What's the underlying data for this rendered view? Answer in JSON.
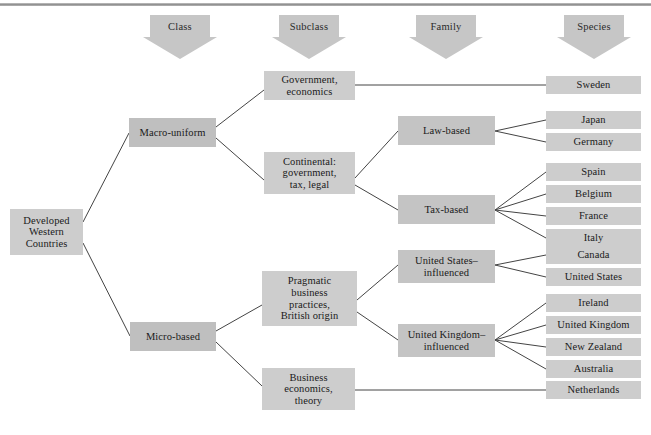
{
  "diagram": {
    "box_color": "#c9c9c9",
    "line_color": "#444444",
    "arrow_color": "#c6c6c6",
    "headers": [
      {
        "id": "class",
        "label": "Class"
      },
      {
        "id": "subclass",
        "label": "Subclass"
      },
      {
        "id": "family",
        "label": "Family"
      },
      {
        "id": "species",
        "label": "Species"
      }
    ],
    "root": {
      "id": "root",
      "label": "Developed\nWestern\nCountries"
    },
    "classes": [
      {
        "id": "macro",
        "label": "Macro-uniform"
      },
      {
        "id": "micro",
        "label": "Micro-based"
      }
    ],
    "subclasses": [
      {
        "id": "gov-econ",
        "label": "Government,\neconomics"
      },
      {
        "id": "continental",
        "label": "Continental:\ngovernment,\ntax, legal"
      },
      {
        "id": "pragmatic",
        "label": "Pragmatic\nbusiness\npractices,\nBritish origin"
      },
      {
        "id": "bus-econ",
        "label": "Business\neconomics,\ntheory"
      }
    ],
    "families": [
      {
        "id": "law-based",
        "label": "Law-based"
      },
      {
        "id": "tax-based",
        "label": "Tax-based"
      },
      {
        "id": "us-infl",
        "label": "United States–\ninfluenced"
      },
      {
        "id": "uk-infl",
        "label": "United Kingdom–\ninfluenced"
      }
    ],
    "species": [
      {
        "id": "sweden",
        "label": "Sweden"
      },
      {
        "id": "japan",
        "label": "Japan"
      },
      {
        "id": "germany",
        "label": "Germany"
      },
      {
        "id": "spain",
        "label": "Spain"
      },
      {
        "id": "belgium",
        "label": "Belgium"
      },
      {
        "id": "france",
        "label": "France"
      },
      {
        "id": "italy",
        "label": "Italy"
      },
      {
        "id": "canada",
        "label": "Canada"
      },
      {
        "id": "united-states",
        "label": "United States"
      },
      {
        "id": "ireland",
        "label": "Ireland"
      },
      {
        "id": "united-kingdom",
        "label": "United Kingdom"
      },
      {
        "id": "new-zealand",
        "label": "New Zealand"
      },
      {
        "id": "australia",
        "label": "Australia"
      },
      {
        "id": "netherlands",
        "label": "Netherlands"
      }
    ],
    "links": [
      [
        "root",
        "macro"
      ],
      [
        "root",
        "micro"
      ],
      [
        "macro",
        "gov-econ"
      ],
      [
        "macro",
        "continental"
      ],
      [
        "micro",
        "pragmatic"
      ],
      [
        "micro",
        "bus-econ"
      ],
      [
        "gov-econ",
        "sweden"
      ],
      [
        "continental",
        "law-based"
      ],
      [
        "continental",
        "tax-based"
      ],
      [
        "law-based",
        "japan"
      ],
      [
        "law-based",
        "germany"
      ],
      [
        "tax-based",
        "spain"
      ],
      [
        "tax-based",
        "belgium"
      ],
      [
        "tax-based",
        "france"
      ],
      [
        "tax-based",
        "italy"
      ],
      [
        "pragmatic",
        "us-infl"
      ],
      [
        "pragmatic",
        "uk-infl"
      ],
      [
        "us-infl",
        "canada"
      ],
      [
        "us-infl",
        "united-states"
      ],
      [
        "uk-infl",
        "ireland"
      ],
      [
        "uk-infl",
        "united-kingdom"
      ],
      [
        "uk-infl",
        "new-zealand"
      ],
      [
        "uk-infl",
        "australia"
      ],
      [
        "bus-econ",
        "netherlands"
      ]
    ]
  }
}
